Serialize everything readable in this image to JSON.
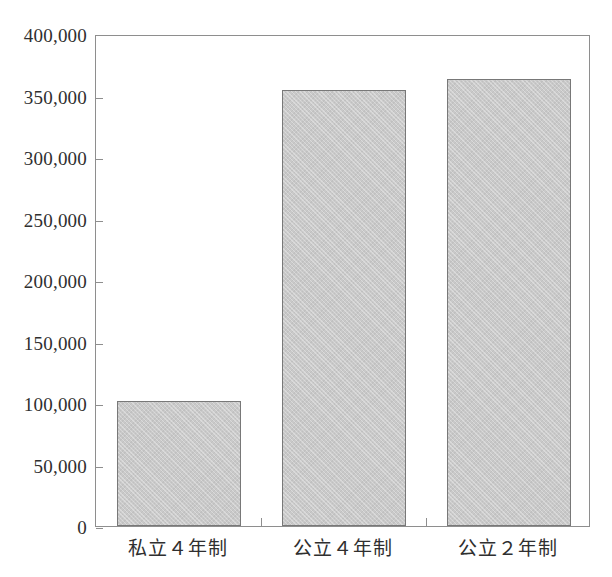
{
  "chart_data": {
    "type": "bar",
    "title": "",
    "subtitle": "",
    "xlabel": "",
    "ylabel": "",
    "categories": [
      "私立４年制",
      "公立４年制",
      "公立２年制"
    ],
    "values": [
      101751,
      354564,
      363798
    ],
    "value_labels": [
      "101,751",
      "354,564",
      "363,798"
    ],
    "ylim": [
      0,
      400000
    ],
    "ytick_values": [
      0,
      50000,
      100000,
      150000,
      200000,
      250000,
      300000,
      350000,
      400000
    ],
    "ytick_labels": [
      "0",
      "50,000",
      "100,000",
      "150,000",
      "200,000",
      "250,000",
      "300,000",
      "350,000",
      "400,000"
    ],
    "grid": false,
    "legend": false,
    "legend_position": "none",
    "bar_fill_color": "#c9c9c9",
    "bar_edge_color": "#787878",
    "axis_color": "#8e8e8e",
    "text_color": "#2f2f2f",
    "background_color": "#ffffff"
  }
}
